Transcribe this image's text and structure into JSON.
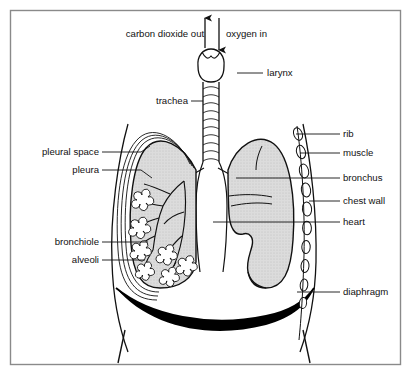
{
  "figure": {
    "frame_color": "#8a8a8a",
    "line_color": "#111111",
    "lung_fill": "#d8d8d8",
    "diaphragm_color": "#000000",
    "background": "#ffffff"
  },
  "arrows": [
    {
      "name": "carbon-dioxide-out",
      "label": "carbon dioxide out",
      "direction": "up"
    },
    {
      "name": "oxygen-in",
      "label": "oxygen in",
      "direction": "down"
    }
  ],
  "labels_top": {
    "carbon_dioxide_out": "carbon dioxide out",
    "oxygen_in": "oxygen in"
  },
  "labels_right": [
    {
      "id": "larynx",
      "text": "larynx"
    },
    {
      "id": "rib",
      "text": "rib"
    },
    {
      "id": "muscle",
      "text": "muscle"
    },
    {
      "id": "bronchus",
      "text": "bronchus"
    },
    {
      "id": "chest-wall",
      "text": "chest wall"
    },
    {
      "id": "heart",
      "text": "heart"
    },
    {
      "id": "diaphragm",
      "text": "diaphragm"
    }
  ],
  "labels_left": [
    {
      "id": "trachea",
      "text": "trachea"
    },
    {
      "id": "pleural-space",
      "text": "pleural space"
    },
    {
      "id": "pleura",
      "text": "pleura"
    },
    {
      "id": "bronchiole",
      "text": "bronchiole"
    },
    {
      "id": "alveoli",
      "text": "alveoli"
    }
  ]
}
